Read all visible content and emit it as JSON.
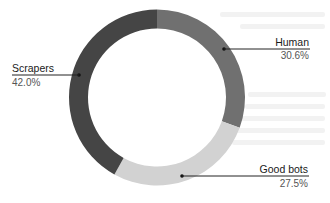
{
  "chart_data": {
    "type": "pie",
    "subtype": "donut",
    "title": "",
    "start_angle_deg": 0,
    "direction": "clockwise",
    "categories": [
      "Human",
      "Good bots",
      "Scrapers"
    ],
    "values": [
      30.6,
      27.5,
      42.0
    ],
    "unit": "%",
    "colors": [
      "#707070",
      "#d2d2d2",
      "#454545"
    ],
    "labels": [
      {
        "name": "Human",
        "value_text": "30.6%"
      },
      {
        "name": "Good bots",
        "value_text": "27.5%"
      },
      {
        "name": "Scrapers",
        "value_text": "42.0%"
      }
    ],
    "legend": "none (leader-line labels)",
    "grid": false
  }
}
